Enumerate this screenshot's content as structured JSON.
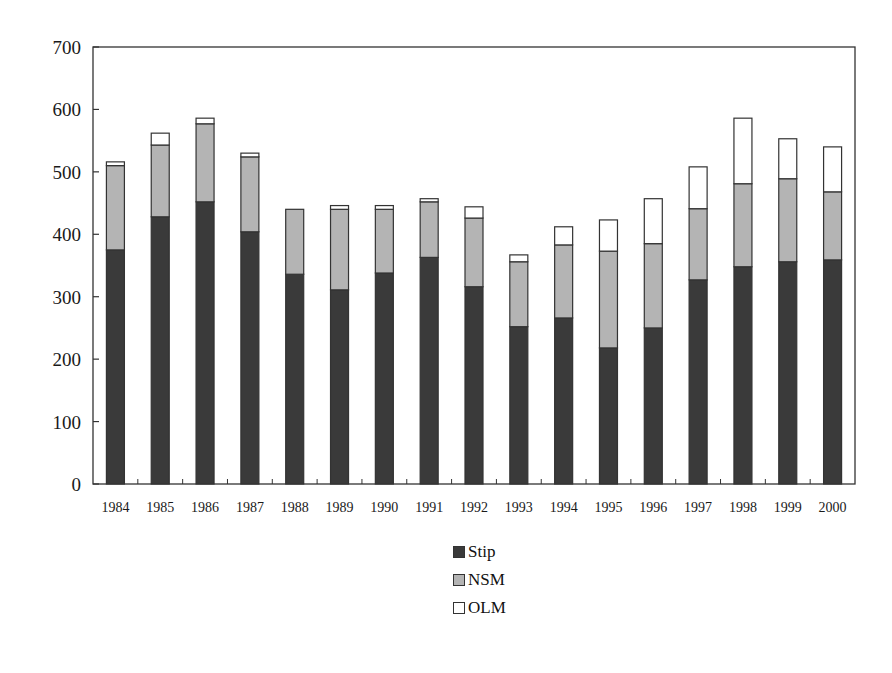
{
  "chart_data": {
    "type": "bar",
    "stacked": true,
    "title": "",
    "xlabel": "",
    "ylabel": "",
    "ylim": [
      0,
      700
    ],
    "yticks": [
      0,
      100,
      200,
      300,
      400,
      500,
      600,
      700
    ],
    "grid": false,
    "legend_position": "bottom-center",
    "categories": [
      "1984",
      "1985",
      "1986",
      "1987",
      "1988",
      "1989",
      "1990",
      "1991",
      "1992",
      "1993",
      "1994",
      "1995",
      "1996",
      "1997",
      "1998",
      "1999",
      "2000"
    ],
    "series": [
      {
        "name": "Stip",
        "color": "#3a3a3a",
        "values": [
          375,
          428,
          452,
          404,
          336,
          311,
          338,
          363,
          316,
          252,
          266,
          218,
          250,
          327,
          348,
          356,
          359
        ]
      },
      {
        "name": "NSM",
        "color": "#b4b4b4",
        "values": [
          135,
          115,
          125,
          120,
          104,
          129,
          102,
          89,
          110,
          104,
          117,
          155,
          135,
          114,
          133,
          133,
          109
        ]
      },
      {
        "name": "OLM",
        "color": "#ffffff",
        "values": [
          6,
          19,
          9,
          6,
          0,
          6,
          6,
          5,
          18,
          11,
          29,
          50,
          72,
          67,
          105,
          64,
          72
        ]
      }
    ]
  },
  "legend": {
    "items": [
      {
        "label": "Stip",
        "color": "#3a3a3a"
      },
      {
        "label": "NSM",
        "color": "#b4b4b4"
      },
      {
        "label": "OLM",
        "color": "#ffffff"
      }
    ]
  }
}
